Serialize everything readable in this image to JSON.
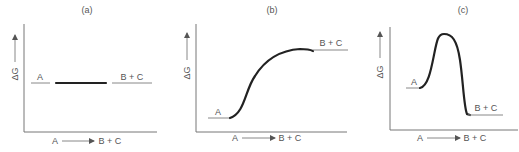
{
  "figure": {
    "panels": [
      {
        "id": "a",
        "title": "(a)",
        "y_axis_label": "ΔG",
        "x_axis_label_start": "A",
        "x_axis_label_end": "B + C",
        "start_label": "A",
        "end_label": "B + C",
        "profile": "flat"
      },
      {
        "id": "b",
        "title": "(b)",
        "y_axis_label": "ΔG",
        "x_axis_label_start": "A",
        "x_axis_label_end": "B + C",
        "start_label": "A",
        "end_label": "B + C",
        "profile": "uphill"
      },
      {
        "id": "c",
        "title": "(c)",
        "y_axis_label": "ΔG",
        "x_axis_label_start": "A",
        "x_axis_label_end": "B + C",
        "start_label": "A",
        "end_label": "B + C",
        "profile": "barrier-downhill"
      }
    ],
    "colors": {
      "curve": "#222222",
      "axis": "#777777",
      "text": "#555555"
    }
  }
}
